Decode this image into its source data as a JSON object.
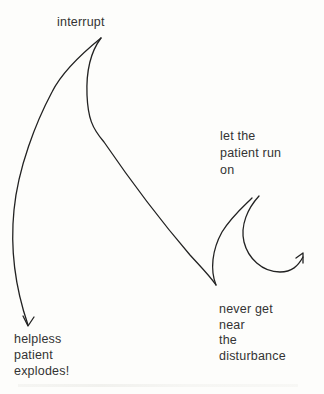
{
  "diagram": {
    "type": "hand-drawn flow sketch",
    "nodes": {
      "interrupt": {
        "lines": [
          "interrupt"
        ]
      },
      "run_on": {
        "lines": [
          "let the",
          "patient run",
          "on"
        ]
      },
      "never_near": {
        "lines": [
          "never get",
          "near",
          "the",
          "disturbance"
        ]
      },
      "explodes": {
        "lines": [
          "helpless",
          "patient",
          "explodes!"
        ]
      }
    },
    "edges": [
      {
        "from": "interrupt",
        "to": "explodes",
        "style": "curved arrow"
      },
      {
        "from": "interrupt",
        "to": "never_near",
        "style": "curved line"
      },
      {
        "from": "never_near",
        "to": "run_on",
        "style": "looping curved arrow"
      }
    ],
    "colors": {
      "ink": "#222222",
      "text": "#333333",
      "background": "#fdfdfb"
    }
  }
}
